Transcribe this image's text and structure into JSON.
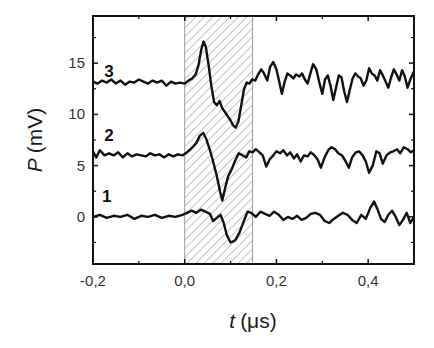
{
  "chart_data": {
    "type": "line",
    "title": "",
    "xlabel": "t (μs)",
    "xlabel_italic_part": "t",
    "xlabel_unit": "(μs)",
    "ylabel": "P (mV)",
    "ylabel_italic_part": "P",
    "ylabel_unit": "(mV)",
    "xlim": [
      -0.2,
      0.5
    ],
    "ylim": [
      -4.6,
      19.6
    ],
    "x_ticks": [
      -0.2,
      0.0,
      0.2,
      0.4
    ],
    "x_tick_labels": [
      "-0,2",
      "0,0",
      "0,2",
      "0,4"
    ],
    "x_minor_ticks": [
      -0.1,
      0.1,
      0.3,
      0.5
    ],
    "y_ticks": [
      0,
      5,
      10,
      15
    ],
    "y_tick_labels": [
      "0",
      "5",
      "10",
      "15"
    ],
    "y_minor_ticks": [
      -2.5,
      2.5,
      7.5,
      12.5,
      17.5
    ],
    "grid": false,
    "legend": "none",
    "shaded_region": {
      "x_start": 0.0,
      "x_end": 0.148,
      "pattern": "diagonal-hatch",
      "color": "#9a9a9a"
    },
    "series": [
      {
        "name": "1",
        "label_position": {
          "t": -0.17,
          "P": 2.0
        },
        "color": "#111111",
        "points": [
          [
            -0.2,
            0.0
          ],
          [
            -0.185,
            0.2
          ],
          [
            -0.17,
            -0.1
          ],
          [
            -0.155,
            0.1
          ],
          [
            -0.14,
            0.0
          ],
          [
            -0.125,
            0.2
          ],
          [
            -0.11,
            -0.2
          ],
          [
            -0.095,
            0.1
          ],
          [
            -0.08,
            0.0
          ],
          [
            -0.065,
            0.2
          ],
          [
            -0.05,
            -0.1
          ],
          [
            -0.035,
            0.1
          ],
          [
            -0.02,
            0.0
          ],
          [
            -0.005,
            0.2
          ],
          [
            0.005,
            0.4
          ],
          [
            0.015,
            0.6
          ],
          [
            0.025,
            0.4
          ],
          [
            0.035,
            0.7
          ],
          [
            0.045,
            0.5
          ],
          [
            0.055,
            0.3
          ],
          [
            0.062,
            -0.4
          ],
          [
            0.07,
            -0.1
          ],
          [
            0.078,
            0.2
          ],
          [
            0.085,
            -0.6
          ],
          [
            0.092,
            -1.8
          ],
          [
            0.1,
            -2.5
          ],
          [
            0.11,
            -2.3
          ],
          [
            0.12,
            -1.5
          ],
          [
            0.13,
            -0.3
          ],
          [
            0.137,
            0.5
          ],
          [
            0.145,
            0.4
          ],
          [
            0.155,
            0.0
          ],
          [
            0.165,
            0.5
          ],
          [
            0.175,
            0.3
          ],
          [
            0.185,
            0.1
          ],
          [
            0.195,
            0.5
          ],
          [
            0.205,
            0.2
          ],
          [
            0.215,
            -0.3
          ],
          [
            0.225,
            0.0
          ],
          [
            0.235,
            -0.2
          ],
          [
            0.245,
            0.1
          ],
          [
            0.255,
            -0.3
          ],
          [
            0.265,
            -0.1
          ],
          [
            0.275,
            0.3
          ],
          [
            0.285,
            0.4
          ],
          [
            0.295,
            0.2
          ],
          [
            0.305,
            -0.4
          ],
          [
            0.315,
            -0.6
          ],
          [
            0.325,
            -0.2
          ],
          [
            0.335,
            0.1
          ],
          [
            0.345,
            0.4
          ],
          [
            0.355,
            0.2
          ],
          [
            0.365,
            -0.3
          ],
          [
            0.375,
            -0.6
          ],
          [
            0.385,
            0.2
          ],
          [
            0.395,
            -0.2
          ],
          [
            0.405,
            0.9
          ],
          [
            0.413,
            1.5
          ],
          [
            0.42,
            0.8
          ],
          [
            0.428,
            -0.2
          ],
          [
            0.436,
            -0.5
          ],
          [
            0.444,
            0.2
          ],
          [
            0.452,
            0.6
          ],
          [
            0.46,
            0.0
          ],
          [
            0.468,
            -0.8
          ],
          [
            0.476,
            -0.3
          ],
          [
            0.484,
            0.4
          ],
          [
            0.492,
            -0.6
          ],
          [
            0.5,
            0.0
          ]
        ]
      },
      {
        "name": "2",
        "label_position": {
          "t": -0.165,
          "P": 8.0
        },
        "color": "#111111",
        "points": [
          [
            -0.2,
            6.4
          ],
          [
            -0.193,
            5.8
          ],
          [
            -0.185,
            6.5
          ],
          [
            -0.175,
            6.0
          ],
          [
            -0.165,
            6.2
          ],
          [
            -0.155,
            6.0
          ],
          [
            -0.145,
            6.3
          ],
          [
            -0.135,
            5.8
          ],
          [
            -0.125,
            6.2
          ],
          [
            -0.115,
            5.9
          ],
          [
            -0.105,
            6.1
          ],
          [
            -0.095,
            6.0
          ],
          [
            -0.085,
            5.9
          ],
          [
            -0.075,
            6.2
          ],
          [
            -0.065,
            6.0
          ],
          [
            -0.055,
            6.1
          ],
          [
            -0.045,
            5.8
          ],
          [
            -0.035,
            6.1
          ],
          [
            -0.025,
            5.9
          ],
          [
            -0.015,
            6.1
          ],
          [
            -0.005,
            6.0
          ],
          [
            0.005,
            6.3
          ],
          [
            0.015,
            6.7
          ],
          [
            0.025,
            7.2
          ],
          [
            0.033,
            7.9
          ],
          [
            0.04,
            8.2
          ],
          [
            0.047,
            7.6
          ],
          [
            0.055,
            6.5
          ],
          [
            0.062,
            5.4
          ],
          [
            0.07,
            4.0
          ],
          [
            0.077,
            2.5
          ],
          [
            0.082,
            1.6
          ],
          [
            0.088,
            2.8
          ],
          [
            0.095,
            4.0
          ],
          [
            0.102,
            4.6
          ],
          [
            0.11,
            5.5
          ],
          [
            0.118,
            6.2
          ],
          [
            0.126,
            6.0
          ],
          [
            0.134,
            5.8
          ],
          [
            0.141,
            6.4
          ],
          [
            0.148,
            6.3
          ],
          [
            0.155,
            6.6
          ],
          [
            0.163,
            6.3
          ],
          [
            0.17,
            6.0
          ],
          [
            0.178,
            4.9
          ],
          [
            0.185,
            5.6
          ],
          [
            0.193,
            6.0
          ],
          [
            0.2,
            6.4
          ],
          [
            0.208,
            6.2
          ],
          [
            0.215,
            6.5
          ],
          [
            0.223,
            6.0
          ],
          [
            0.23,
            6.3
          ],
          [
            0.238,
            5.7
          ],
          [
            0.245,
            6.1
          ],
          [
            0.253,
            5.4
          ],
          [
            0.26,
            6.0
          ],
          [
            0.268,
            5.9
          ],
          [
            0.275,
            6.3
          ],
          [
            0.283,
            6.0
          ],
          [
            0.29,
            5.6
          ],
          [
            0.297,
            4.8
          ],
          [
            0.305,
            5.8
          ],
          [
            0.313,
            6.5
          ],
          [
            0.32,
            6.8
          ],
          [
            0.328,
            6.6
          ],
          [
            0.335,
            6.2
          ],
          [
            0.343,
            6.0
          ],
          [
            0.35,
            5.5
          ],
          [
            0.358,
            4.8
          ],
          [
            0.365,
            5.8
          ],
          [
            0.373,
            6.3
          ],
          [
            0.38,
            6.4
          ],
          [
            0.388,
            6.0
          ],
          [
            0.395,
            5.4
          ],
          [
            0.402,
            4.3
          ],
          [
            0.41,
            5.0
          ],
          [
            0.418,
            6.4
          ],
          [
            0.425,
            6.2
          ],
          [
            0.432,
            5.2
          ],
          [
            0.44,
            6.0
          ],
          [
            0.448,
            6.3
          ],
          [
            0.455,
            6.4
          ],
          [
            0.463,
            6.6
          ],
          [
            0.47,
            6.2
          ],
          [
            0.478,
            6.8
          ],
          [
            0.486,
            6.6
          ],
          [
            0.493,
            6.3
          ],
          [
            0.5,
            6.5
          ]
        ]
      },
      {
        "name": "3",
        "label_position": {
          "t": -0.165,
          "P": 14.2
        },
        "color": "#111111",
        "points": [
          [
            -0.2,
            13.2
          ],
          [
            -0.19,
            13.0
          ],
          [
            -0.18,
            13.3
          ],
          [
            -0.17,
            13.1
          ],
          [
            -0.16,
            13.4
          ],
          [
            -0.15,
            13.0
          ],
          [
            -0.14,
            13.3
          ],
          [
            -0.13,
            12.9
          ],
          [
            -0.12,
            13.2
          ],
          [
            -0.11,
            13.1
          ],
          [
            -0.1,
            13.4
          ],
          [
            -0.09,
            13.2
          ],
          [
            -0.08,
            13.0
          ],
          [
            -0.07,
            13.3
          ],
          [
            -0.06,
            13.1
          ],
          [
            -0.05,
            13.3
          ],
          [
            -0.04,
            12.8
          ],
          [
            -0.03,
            13.2
          ],
          [
            -0.02,
            13.0
          ],
          [
            -0.01,
            13.1
          ],
          [
            0.0,
            13.0
          ],
          [
            0.008,
            13.3
          ],
          [
            0.016,
            13.5
          ],
          [
            0.024,
            13.9
          ],
          [
            0.03,
            14.8
          ],
          [
            0.036,
            16.3
          ],
          [
            0.041,
            17.1
          ],
          [
            0.046,
            16.6
          ],
          [
            0.052,
            14.8
          ],
          [
            0.058,
            12.8
          ],
          [
            0.064,
            11.2
          ],
          [
            0.07,
            10.9
          ],
          [
            0.076,
            11.3
          ],
          [
            0.082,
            10.6
          ],
          [
            0.088,
            10.2
          ],
          [
            0.094,
            9.8
          ],
          [
            0.1,
            9.4
          ],
          [
            0.106,
            8.9
          ],
          [
            0.111,
            8.7
          ],
          [
            0.117,
            9.3
          ],
          [
            0.123,
            10.8
          ],
          [
            0.129,
            12.4
          ],
          [
            0.135,
            13.1
          ],
          [
            0.141,
            13.0
          ],
          [
            0.147,
            13.4
          ],
          [
            0.154,
            13.3
          ],
          [
            0.16,
            13.9
          ],
          [
            0.167,
            14.4
          ],
          [
            0.173,
            14.0
          ],
          [
            0.18,
            13.3
          ],
          [
            0.186,
            14.6
          ],
          [
            0.193,
            15.1
          ],
          [
            0.2,
            14.4
          ],
          [
            0.206,
            13.2
          ],
          [
            0.212,
            12.0
          ],
          [
            0.218,
            13.2
          ],
          [
            0.224,
            14.0
          ],
          [
            0.23,
            13.8
          ],
          [
            0.237,
            13.5
          ],
          [
            0.243,
            13.9
          ],
          [
            0.25,
            13.7
          ],
          [
            0.256,
            14.0
          ],
          [
            0.262,
            13.4
          ],
          [
            0.268,
            13.0
          ],
          [
            0.274,
            14.0
          ],
          [
            0.28,
            14.9
          ],
          [
            0.287,
            14.4
          ],
          [
            0.293,
            13.2
          ],
          [
            0.3,
            12.0
          ],
          [
            0.306,
            13.4
          ],
          [
            0.312,
            13.8
          ],
          [
            0.318,
            12.8
          ],
          [
            0.324,
            11.4
          ],
          [
            0.33,
            12.6
          ],
          [
            0.336,
            13.8
          ],
          [
            0.342,
            13.6
          ],
          [
            0.348,
            12.2
          ],
          [
            0.354,
            11.2
          ],
          [
            0.36,
            12.4
          ],
          [
            0.366,
            13.5
          ],
          [
            0.372,
            14.0
          ],
          [
            0.378,
            13.7
          ],
          [
            0.384,
            13.5
          ],
          [
            0.39,
            12.8
          ],
          [
            0.396,
            13.3
          ],
          [
            0.402,
            14.5
          ],
          [
            0.408,
            14.0
          ],
          [
            0.414,
            13.8
          ],
          [
            0.42,
            13.3
          ],
          [
            0.426,
            14.3
          ],
          [
            0.432,
            13.8
          ],
          [
            0.438,
            13.2
          ],
          [
            0.444,
            12.6
          ],
          [
            0.45,
            13.6
          ],
          [
            0.456,
            14.4
          ],
          [
            0.462,
            13.9
          ],
          [
            0.468,
            13.3
          ],
          [
            0.474,
            14.3
          ],
          [
            0.48,
            13.7
          ],
          [
            0.486,
            12.6
          ],
          [
            0.492,
            13.4
          ],
          [
            0.5,
            14.2
          ]
        ]
      }
    ]
  }
}
